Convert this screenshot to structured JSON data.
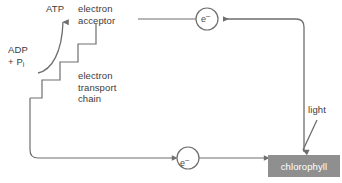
{
  "diagram": {
    "labels": {
      "atp": "ATP",
      "electron_acceptor": "electron\nacceptor",
      "electron_acceptor_line1": "electron",
      "electron_acceptor_line2": "acceptor",
      "adp": "ADP",
      "phosphate": "+ P",
      "phosphate_subscript": "i",
      "electron_transport_chain_line1": "electron",
      "electron_transport_chain_line2": "transport",
      "electron_transport_chain_line3": "chain",
      "light": "light",
      "chlorophyll": "chlorophyll",
      "electron_top": "e",
      "electron_top_charge": "–",
      "electron_bottom": "e",
      "electron_bottom_charge": "–"
    },
    "colors": {
      "stroke": "#6e6e6e",
      "text": "#3b3b3b",
      "chlorophyll_fill": "#8f8f8f",
      "chlorophyll_text": "#ffffff",
      "background": "#ffffff"
    }
  }
}
